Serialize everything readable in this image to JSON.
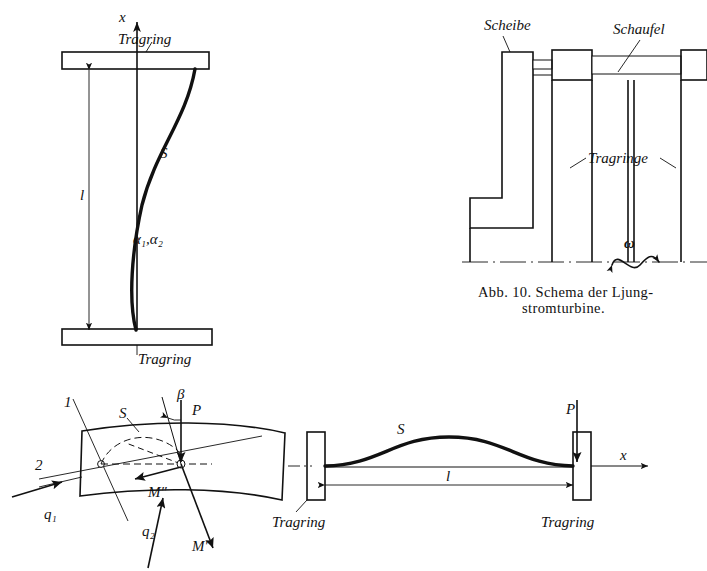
{
  "page": {
    "background_color": "#ffffff",
    "ink_color": "#111111",
    "width": 707,
    "height": 571
  },
  "figures": {
    "left_blade": {
      "name": "Eingespannte Schaufel mit S-Biegelinie",
      "axis_label_x": "x",
      "length_label": "l",
      "curve_label": "S",
      "angle_label": "α₁,α₂",
      "support_top_label": "Tragring",
      "support_bottom_label": "Tragring"
    },
    "turbine_scheme": {
      "label_disc": "Scheibe",
      "label_blade": "Schaufel",
      "label_rings": "Tragringe",
      "label_omega": "ω",
      "caption_line1": "Abb. 10.  Schema der Ljung-",
      "caption_line2": "stromturbine."
    },
    "cross_section": {
      "label_axis1": "1",
      "label_axis2": "2",
      "label_centroid": "S",
      "label_angle_beta": "β",
      "label_force_p": "P",
      "label_moment_second": "M″",
      "label_moment_first": "M′",
      "label_load_q1": "q₁",
      "label_load_q2": "q₂"
    },
    "beam_span": {
      "curve_label": "S",
      "force_label": "P",
      "axis_label_x": "x",
      "length_label": "l",
      "support_left_label": "Tragring",
      "support_right_label": "Tragring"
    }
  }
}
